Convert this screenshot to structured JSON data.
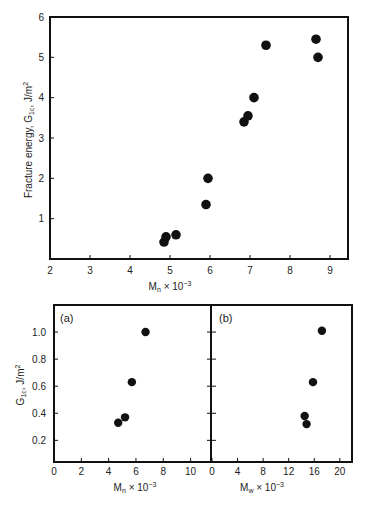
{
  "chart_data": [
    {
      "type": "scatter",
      "panel": "top",
      "title": "",
      "xlabel": "M_n × 10^-3",
      "ylabel": "Fracture energy, G_1c, J/m²",
      "xlim": [
        2,
        9.4
      ],
      "ylim": [
        0,
        6
      ],
      "xticks": [
        2,
        3,
        4,
        5,
        6,
        7,
        8,
        9
      ],
      "yticks": [
        1,
        2,
        3,
        4,
        5,
        6
      ],
      "grid": false,
      "series": [
        {
          "name": "data",
          "x": [
            4.85,
            4.9,
            5.15,
            5.9,
            5.95,
            6.85,
            6.95,
            7.1,
            7.4,
            8.65,
            8.7
          ],
          "y": [
            0.42,
            0.55,
            0.6,
            1.35,
            2.0,
            3.4,
            3.55,
            4.0,
            5.3,
            5.45,
            5.0
          ]
        }
      ]
    },
    {
      "type": "scatter",
      "panel": "bottom-left",
      "panel_label": "(a)",
      "xlabel": "M_n × 10^-3",
      "ylabel": "G_1c, J/m²",
      "xlim": [
        0,
        11.2
      ],
      "ylim": [
        0.04,
        1.2
      ],
      "xticks": [
        0,
        2,
        4,
        6,
        8,
        10
      ],
      "yticks": [
        0.2,
        0.4,
        0.6,
        0.8,
        1.0
      ],
      "grid": false,
      "series": [
        {
          "name": "data",
          "x": [
            4.7,
            5.2,
            5.7,
            6.7
          ],
          "y": [
            0.33,
            0.37,
            0.63,
            1.0
          ]
        }
      ]
    },
    {
      "type": "scatter",
      "panel": "bottom-right",
      "panel_label": "(b)",
      "xlabel": "M_w × 10^-3",
      "ylabel": "",
      "xlim": [
        0,
        20.5
      ],
      "ylim": [
        0.04,
        1.2
      ],
      "xticks": [
        0,
        4,
        8,
        12,
        16,
        20
      ],
      "yticks": [
        0.2,
        0.4,
        0.6,
        0.8,
        1.0
      ],
      "grid": false,
      "series": [
        {
          "name": "data",
          "x": [
            14.5,
            14.8,
            15.8,
            17.2
          ],
          "y": [
            0.38,
            0.32,
            0.63,
            1.01
          ]
        }
      ]
    }
  ],
  "labels": {
    "top_ylabel_main": "Fracture energy, G",
    "top_ylabel_sub": "1c",
    "top_ylabel_unit": ", J/m",
    "top_ylabel_sup": "2",
    "top_xlabel_main": "M",
    "top_xlabel_sub": "n",
    "top_xlabel_rest": " × 10",
    "top_xlabel_sup": "−3",
    "bottom_ylabel_main": "G",
    "bottom_ylabel_sub": "1c",
    "bottom_ylabel_unit": ", J/m",
    "bottom_ylabel_sup": "2",
    "a_label": "(a)",
    "b_label": "(b)",
    "a_xlabel_main": "M",
    "a_xlabel_sub": "n",
    "a_xlabel_rest": " × 10",
    "a_xlabel_sup": "−3",
    "b_xlabel_main": "M",
    "b_xlabel_sub": "w",
    "b_xlabel_rest": " × 10",
    "b_xlabel_sup": "−3"
  },
  "style": {
    "ink": "#111111",
    "background": "#ffffff"
  }
}
